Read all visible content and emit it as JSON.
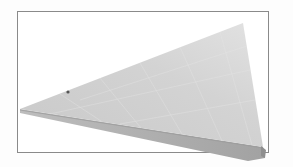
{
  "image": {
    "description": "Framed render of a gray 3D triangular wedge plate",
    "colors": {
      "background": "#fdfdfd",
      "frame": "#8a8a8a",
      "top_face": "#d2d2d2",
      "top_face_light": "#e6e6e6",
      "front_edge": "#a8a8a8",
      "grid": "#e9e9e9",
      "mark": "#555555"
    }
  }
}
